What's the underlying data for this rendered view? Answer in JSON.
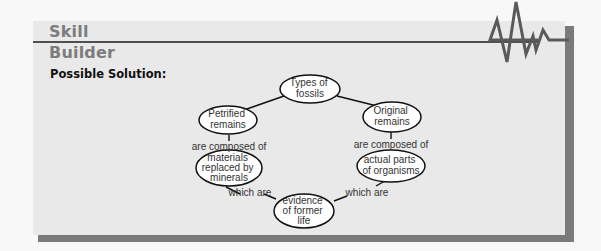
{
  "header": {
    "title_line1": "Skill",
    "title_line2": "Builder",
    "subtitle": "Possible Solution:"
  },
  "concept_map": {
    "nodes": [
      {
        "id": "types",
        "lines": [
          "Types of",
          "fossils"
        ]
      },
      {
        "id": "petrified",
        "lines": [
          "Petrified",
          "remains"
        ]
      },
      {
        "id": "original",
        "lines": [
          "Original",
          "remains"
        ]
      },
      {
        "id": "materials",
        "lines": [
          "materials",
          "replaced by",
          "minerals"
        ]
      },
      {
        "id": "actual",
        "lines": [
          "actual parts",
          "of organisms"
        ]
      },
      {
        "id": "evidence",
        "lines": [
          "evidence",
          "of former",
          "life"
        ]
      }
    ],
    "links": [
      {
        "from": "types",
        "to": "petrified",
        "label": ""
      },
      {
        "from": "types",
        "to": "original",
        "label": ""
      },
      {
        "from": "petrified",
        "to": "materials",
        "label": "are composed of"
      },
      {
        "from": "original",
        "to": "actual",
        "label": "are composed of"
      },
      {
        "from": "materials",
        "to": "evidence",
        "label": "which are"
      },
      {
        "from": "actual",
        "to": "evidence",
        "label": "which are"
      }
    ]
  },
  "colors": {
    "panel": "#e9e9e9",
    "shadow": "#7a7a7a",
    "title": "#7c7c7c",
    "line": "#4f4f4f"
  }
}
